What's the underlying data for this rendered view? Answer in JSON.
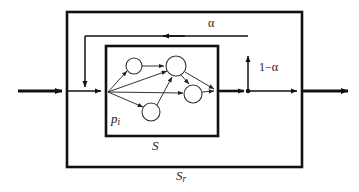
{
  "diagram": {
    "type": "block-diagram",
    "colors": {
      "stroke": "#111111",
      "background": "#ffffff",
      "thin_stroke": "#333333"
    },
    "labels": {
      "alpha": "α",
      "one_minus_alpha": "1−α",
      "p_i_base": "p",
      "p_i_sub": "i",
      "s": "S",
      "s_r_base": "S",
      "s_r_sub": "r"
    },
    "boxes": [
      {
        "name": "outer-box",
        "label": "S_r",
        "x": 67,
        "y": 12,
        "width": 235,
        "height": 155,
        "stroke_width": 2.5
      },
      {
        "name": "inner-box",
        "label": "S",
        "x": 106,
        "y": 46,
        "width": 112,
        "height": 90,
        "stroke_width": 2.5
      }
    ],
    "nodes": [
      {
        "name": "source-vertex",
        "cx": 108,
        "cy": 92,
        "r": 0
      },
      {
        "name": "node-top-left",
        "cx": 134,
        "cy": 66,
        "r": 8
      },
      {
        "name": "node-top-middle",
        "cx": 176,
        "cy": 66,
        "r": 10
      },
      {
        "name": "node-right",
        "cx": 193,
        "cy": 94,
        "r": 9
      },
      {
        "name": "node-bottom",
        "cx": 151,
        "cy": 112,
        "r": 9
      }
    ],
    "junction": {
      "name": "split-junction",
      "cx": 248,
      "cy": 91,
      "r": 2.2
    },
    "signal_flow": {
      "input_label": "",
      "output_label": "",
      "feedback_label": "α",
      "forward_label": "1−α"
    }
  }
}
